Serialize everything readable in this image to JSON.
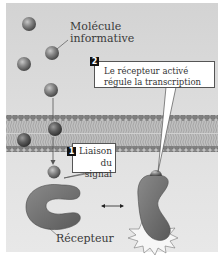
{
  "diagram": {
    "labels": {
      "molecule_line1": "Molécule",
      "molecule_line2": "informative",
      "receptor": "Récepteur"
    },
    "steps": [
      {
        "number": "1",
        "text_line1": "Liaison",
        "text_line2": "du signal"
      },
      {
        "number": "2",
        "text_line1": "Le récepteur activé",
        "text_line2": "régule la transcription"
      }
    ],
    "colors": {
      "background": "#dcdcdc",
      "molecule": "#7a7a7a",
      "receptor": "#6e6e6e",
      "membrane_head": "#8a8a8a",
      "membrane_tail": "#b5b5b5",
      "callout_bg": "#ffffff",
      "badge": "#111111"
    },
    "arrow": "equilibrium-double-arrow"
  }
}
